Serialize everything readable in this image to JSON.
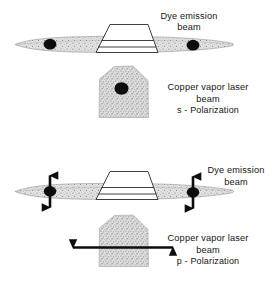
{
  "figure": {
    "background_color": "#ffffff",
    "ink_color": "#151515",
    "beam_fill_color": "#d9d9d9",
    "dot_color": "#0d0d0d"
  },
  "panels": [
    {
      "id": "top",
      "polarization": "s",
      "labels": {
        "dye_beam_line1": "Dye emission",
        "dye_beam_line2": "beam",
        "pump_line1": "Copper vapor laser",
        "pump_line2": "beam",
        "pump_line3": "s - Polarization"
      },
      "dye_beam": {
        "orientation": "horizontal",
        "spots": 2,
        "polarization_arrows": "none"
      },
      "pump_beam": {
        "shape": "pentagon-blob",
        "spot": "center-dot",
        "polarization_arrows": "none"
      }
    },
    {
      "id": "bottom",
      "polarization": "p",
      "labels": {
        "dye_beam_line1": "Dye emission",
        "dye_beam_line2": "beam",
        "pump_line1": "Copper vapor laser",
        "pump_line2": "beam",
        "pump_line3": "p - Polarization"
      },
      "dye_beam": {
        "orientation": "horizontal",
        "spots": 2,
        "polarization_arrows": "vertical-double-headed"
      },
      "pump_beam": {
        "shape": "pentagon-blob",
        "spot": "none",
        "polarization_arrows": "horizontal-double-headed"
      }
    }
  ],
  "elements": {
    "prism_name": "dye cell prism",
    "prism_count": 2
  },
  "footer": {
    "cut_caption": " "
  }
}
